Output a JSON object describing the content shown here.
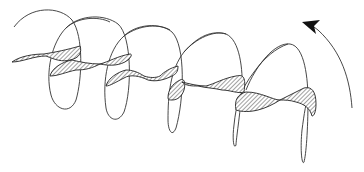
{
  "diagram": {
    "type": "helical-vortex-illustration",
    "colors": {
      "background": "#ffffff",
      "line": "#333333",
      "hatch": "#444444",
      "arrowhead": "#111111"
    },
    "elements": {
      "loop_count": 5,
      "ribbon_segments": 5,
      "arrow": {
        "direction": "counter-clockwise",
        "icon": "curved-arrow-icon"
      }
    }
  }
}
